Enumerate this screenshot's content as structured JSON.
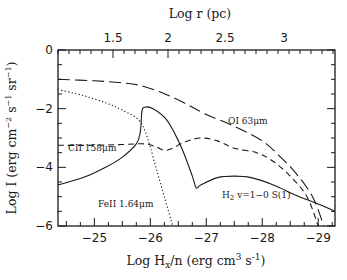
{
  "chart_data": {
    "type": "line",
    "title": "",
    "xlabel": "Log H_x/n (erg cm^3 s^-1)",
    "xlabel_parts": {
      "pre": "Log H",
      "sub": "x",
      "post": "/n (erg cm",
      "sup1": "3",
      "mid": " s",
      "sup2": "-1",
      "end": ")"
    },
    "ylabel": "Log I (erg cm^-2 s^-1 sr^-1)",
    "top_xlabel": "Log r (pc)",
    "xlim": [
      -24.35,
      -29.3
    ],
    "ylim": [
      -6,
      0
    ],
    "x_ticks": [
      -25,
      -26,
      -27,
      -28,
      -29
    ],
    "x_tick_labels": [
      "−25",
      "−26",
      "−27",
      "−28",
      "−29"
    ],
    "y_ticks": [
      0,
      -2,
      -4,
      -6
    ],
    "y_tick_labels": [
      "0",
      "−2",
      "−4",
      "−6"
    ],
    "top_ticks_px": [
      113,
      168,
      225,
      284
    ],
    "top_tick_labels": [
      "1.5",
      "2",
      "2.5",
      "3"
    ],
    "grid": false,
    "legend": "inline annotations",
    "series": [
      {
        "name": "OI 63μm",
        "style": "long-dash",
        "x": [
          -24.35,
          -25.0,
          -25.5,
          -25.8,
          -26.2,
          -26.6,
          -27.0,
          -27.5,
          -28.0,
          -28.3,
          -28.6,
          -28.9,
          -29.1
        ],
        "y": [
          -1.0,
          -1.05,
          -1.12,
          -1.2,
          -1.45,
          -1.8,
          -2.2,
          -2.6,
          -3.1,
          -3.6,
          -4.2,
          -5.0,
          -6.0
        ]
      },
      {
        "name": "CII 158μm",
        "style": "short-dash",
        "x": [
          -24.35,
          -25.0,
          -25.5,
          -25.9,
          -26.1,
          -26.3,
          -26.6,
          -26.9,
          -27.2,
          -27.5,
          -27.9,
          -28.2,
          -28.5,
          -28.8,
          -29.0
        ],
        "y": [
          -3.25,
          -3.25,
          -3.22,
          -3.2,
          -3.3,
          -3.42,
          -3.15,
          -3.0,
          -3.1,
          -3.35,
          -3.5,
          -3.8,
          -4.3,
          -5.0,
          -6.0
        ]
      },
      {
        "name": "FeII 1.64μm",
        "style": "dotted",
        "x": [
          -24.35,
          -24.8,
          -25.2,
          -25.5,
          -25.8,
          -25.95,
          -26.1,
          -26.25,
          -26.4
        ],
        "y": [
          -1.35,
          -1.55,
          -1.8,
          -2.05,
          -2.4,
          -3.0,
          -4.0,
          -5.0,
          -6.0
        ]
      },
      {
        "name": "H₂ v=1−0 S(1)",
        "style": "solid",
        "x": [
          -24.35,
          -24.8,
          -25.2,
          -25.5,
          -25.75,
          -25.82,
          -25.85,
          -25.9,
          -26.05,
          -26.3,
          -26.55,
          -26.75,
          -26.82,
          -26.9,
          -27.2,
          -27.5,
          -27.8,
          -28.2,
          -28.6,
          -29.0,
          -29.3
        ],
        "y": [
          -4.6,
          -4.35,
          -4.0,
          -3.65,
          -3.2,
          -2.8,
          -2.1,
          -1.95,
          -2.0,
          -2.4,
          -3.3,
          -4.3,
          -4.7,
          -4.6,
          -4.35,
          -4.3,
          -4.35,
          -4.6,
          -4.95,
          -5.25,
          -5.5
        ]
      }
    ],
    "annotations": [
      {
        "text": "OI 63μm",
        "x": 228,
        "y": 124
      },
      {
        "text": "CII 158μm",
        "x": 68,
        "y": 151
      },
      {
        "text": "FeII 1.64μm",
        "x": 98,
        "y": 207
      },
      {
        "text": "H",
        "sub": "2",
        "rest": " v=1−0 S(1)",
        "x": 222,
        "y": 198
      }
    ]
  }
}
